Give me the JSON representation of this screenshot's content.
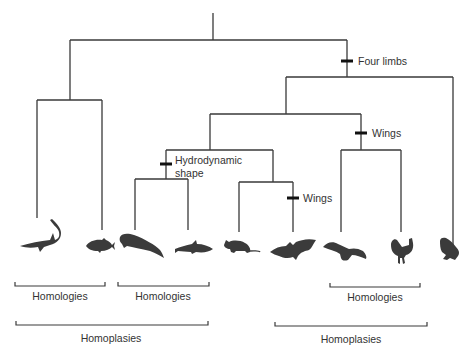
{
  "diagram": {
    "type": "cladogram",
    "taxa": [
      {
        "id": "shark",
        "name": "Shark"
      },
      {
        "id": "tuna",
        "name": "Tuna"
      },
      {
        "id": "whale",
        "name": "Sperm whale"
      },
      {
        "id": "dolphin",
        "name": "Dolphin"
      },
      {
        "id": "rat",
        "name": "Rat"
      },
      {
        "id": "bat",
        "name": "Bat"
      },
      {
        "id": "eagle",
        "name": "Eagle"
      },
      {
        "id": "rooster",
        "name": "Rooster"
      },
      {
        "id": "frog",
        "name": "Frog"
      }
    ],
    "characters": [
      {
        "id": "four-limbs",
        "label": "Four limbs"
      },
      {
        "id": "wings-birds",
        "label": "Wings"
      },
      {
        "id": "hydrodynamic",
        "label_line1": "Hydrodynamic",
        "label_line2": "shape"
      },
      {
        "id": "wings-bat",
        "label": "Wings"
      }
    ],
    "groupings": [
      {
        "id": "homologies-fish",
        "label": "Homologies",
        "members": [
          "shark",
          "tuna"
        ]
      },
      {
        "id": "homologies-cetaceans",
        "label": "Homologies",
        "members": [
          "whale",
          "dolphin"
        ]
      },
      {
        "id": "homologies-birds",
        "label": "Homologies",
        "members": [
          "eagle",
          "rooster"
        ]
      },
      {
        "id": "homoplasies-aquatic",
        "label": "Homoplasies",
        "members": [
          "shark",
          "tuna",
          "whale",
          "dolphin"
        ]
      },
      {
        "id": "homoplasies-flight",
        "label": "Homoplasies",
        "members": [
          "bat",
          "eagle",
          "rooster"
        ]
      }
    ]
  }
}
